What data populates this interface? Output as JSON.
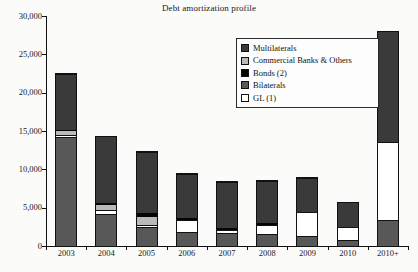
{
  "chart_data": {
    "type": "bar",
    "subtype": "stacked-vertical",
    "title": "Debt amortization profile",
    "xlabel": "",
    "ylabel": "",
    "ylim": [
      0,
      30000
    ],
    "ytick_values": [
      0,
      5000,
      10000,
      15000,
      20000,
      25000,
      30000
    ],
    "ytick_labels": [
      "0",
      "5,000",
      "10,000",
      "15,000",
      "20,000",
      "25,000",
      "30,000"
    ],
    "grid": false,
    "legend_position": "upper-center-right",
    "categories": [
      "2003",
      "2004",
      "2005",
      "2006",
      "2007",
      "2008",
      "2009",
      "2010",
      "2010+"
    ],
    "stack_order_bottom_to_top": [
      "Bilaterals",
      "GL (1)",
      "Commercial Banks & Others",
      "Bonds (2)",
      "Multilaterals"
    ],
    "series": [
      {
        "name": "Bilaterals",
        "color": "#585858",
        "values": [
          14100,
          4100,
          2400,
          1700,
          1550,
          1500,
          1200,
          700,
          3300
        ]
      },
      {
        "name": "GL (1)",
        "color": "#ffffff",
        "values": [
          400,
          550,
          400,
          1750,
          500,
          1200,
          3200,
          1800,
          10300
        ]
      },
      {
        "name": "Commercial Banks & Others",
        "color": "#b9b9b9",
        "values": [
          450,
          750,
          950,
          0,
          100,
          0,
          0,
          0,
          0
        ]
      },
      {
        "name": "Bonds (2)",
        "color": "#050505",
        "values": [
          200,
          200,
          550,
          200,
          250,
          250,
          100,
          0,
          0
        ]
      },
      {
        "name": "Multilaterals",
        "color": "#3a3a3a",
        "values": [
          7350,
          8700,
          8000,
          5750,
          6000,
          5500,
          4400,
          3200,
          14400
        ]
      }
    ],
    "totals": [
      22500,
      14300,
      12300,
      9400,
      8400,
      8450,
      8900,
      5700,
      28000
    ]
  },
  "legend": {
    "items": [
      {
        "label": "Multilaterals",
        "swatch_name": "legend-swatch-multilaterals",
        "color": "#3a3a3a"
      },
      {
        "label": "Commercial Banks & Others",
        "swatch_name": "legend-swatch-commercial",
        "color": "#b9b9b9"
      },
      {
        "label": "Bonds (2)",
        "swatch_name": "legend-swatch-bonds",
        "color": "#050505"
      },
      {
        "label": "Bilaterals",
        "swatch_name": "legend-swatch-bilaterals",
        "color": "#585858"
      },
      {
        "label": "GL (1)",
        "swatch_name": "legend-swatch-gl",
        "color": "#ffffff"
      }
    ]
  }
}
